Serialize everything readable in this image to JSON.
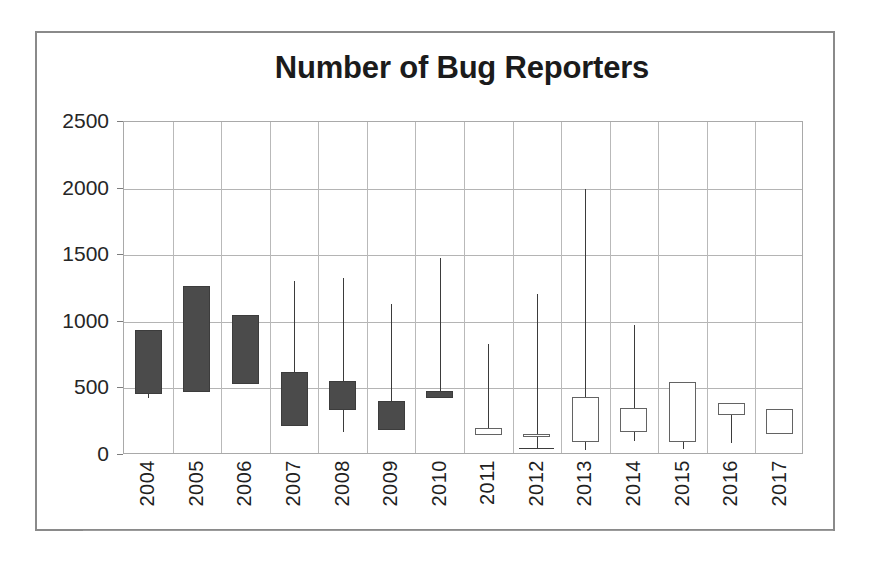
{
  "chart_data": {
    "type": "box",
    "title": "Number of Bug Reporters",
    "xlabel": "",
    "ylabel": "",
    "ylim": [
      0,
      2500
    ],
    "ytick_labels": [
      "0",
      "500",
      "1000",
      "1500",
      "2000",
      "2500"
    ],
    "ytick_values": [
      0,
      500,
      1000,
      1500,
      2000,
      2500
    ],
    "ygrid": true,
    "xgrid": true,
    "legend": null,
    "categories": [
      "2004",
      "2005",
      "2006",
      "2007",
      "2008",
      "2009",
      "2010",
      "2011",
      "2012",
      "2013",
      "2014",
      "2015",
      "2016",
      "2017"
    ],
    "boxes": [
      {
        "year": "2004",
        "q1": 460,
        "q3": 940,
        "whisker_low": 430,
        "whisker_high": 940,
        "style": "filled"
      },
      {
        "year": "2005",
        "q1": 470,
        "q3": 1270,
        "whisker_low": 470,
        "whisker_high": 1270,
        "style": "filled"
      },
      {
        "year": "2006",
        "q1": 530,
        "q3": 1050,
        "whisker_low": 530,
        "whisker_high": 1050,
        "style": "filled"
      },
      {
        "year": "2007",
        "q1": 220,
        "q3": 620,
        "whisker_low": 220,
        "whisker_high": 1310,
        "style": "filled"
      },
      {
        "year": "2008",
        "q1": 340,
        "q3": 555,
        "whisker_low": 175,
        "whisker_high": 1330,
        "style": "filled"
      },
      {
        "year": "2009",
        "q1": 185,
        "q3": 405,
        "whisker_low": 185,
        "whisker_high": 1130,
        "style": "filled"
      },
      {
        "year": "2010",
        "q1": 430,
        "q3": 480,
        "whisker_low": 430,
        "whisker_high": 1480,
        "style": "filled"
      },
      {
        "year": "2011",
        "q1": 150,
        "q3": 205,
        "whisker_low": 150,
        "whisker_high": 835,
        "style": "open"
      },
      {
        "year": "2012",
        "q1": 140,
        "q3": 155,
        "whisker_low": 50,
        "whisker_high": 1210,
        "style": "open"
      },
      {
        "year": "2013",
        "q1": 100,
        "q3": 435,
        "whisker_low": 40,
        "whisker_high": 2000,
        "style": "open"
      },
      {
        "year": "2014",
        "q1": 175,
        "q3": 350,
        "whisker_low": 105,
        "whisker_high": 975,
        "style": "open"
      },
      {
        "year": "2015",
        "q1": 95,
        "q3": 550,
        "whisker_low": 45,
        "whisker_high": 550,
        "style": "open"
      },
      {
        "year": "2016",
        "q1": 300,
        "q3": 390,
        "whisker_low": 90,
        "whisker_high": 390,
        "style": "open"
      },
      {
        "year": "2017",
        "q1": 155,
        "q3": 345,
        "whisker_low": 155,
        "whisker_high": 345,
        "style": "open"
      }
    ]
  },
  "colors": {
    "box_fill_dark": "#4b4b4b",
    "box_fill_light": "#ffffff",
    "box_stroke": "#4a4a4a",
    "gridline": "#b4b4b4",
    "axis": "#9b9b9b",
    "text": "#1b1b1b",
    "frame": "#8a8a8a"
  }
}
